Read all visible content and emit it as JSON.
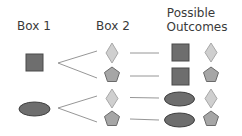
{
  "headers": {
    "box1": "Box 1",
    "box2": "Box 2",
    "outcomes_line1": "Possible",
    "outcomes_line2": "Outcomes"
  },
  "box1": {
    "items": [
      "square",
      "ellipse"
    ]
  },
  "box2": {
    "items": [
      "diamond",
      "pentagon"
    ]
  },
  "outcomes": [
    [
      "square",
      "diamond"
    ],
    [
      "square",
      "pentagon"
    ],
    [
      "ellipse",
      "diamond"
    ],
    [
      "ellipse",
      "pentagon"
    ]
  ],
  "colors": {
    "square_fill": "#6e6e6e",
    "square_stroke": "#4a4a4a",
    "ellipse_fill": "#6e6e6e",
    "ellipse_stroke": "#3e3e3e",
    "diamond_fill": "#cfcfcf",
    "diamond_stroke": "#a8a8a8",
    "pentagon_fill": "#a6a6a6",
    "pentagon_stroke": "#6a6a6a",
    "line": "#8a8a8a",
    "text": "#3a3a3a"
  }
}
